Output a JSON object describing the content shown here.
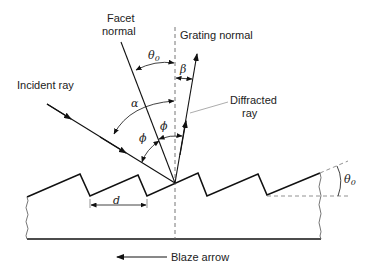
{
  "figure": {
    "labels": {
      "facet_normal_line1": "Facet",
      "facet_normal_line2": "normal",
      "grating_normal": "Grating normal",
      "incident_ray": "Incident ray",
      "diffracted_ray_line1": "Diffracted",
      "diffracted_ray_line2": "ray",
      "blaze_arrow": "Blaze arrow",
      "groove_spacing": "d"
    },
    "angles": {
      "theta0_symbol": "θ",
      "theta0_subscript": "0",
      "alpha": "α",
      "beta": "β",
      "phi": "ϕ"
    },
    "colors": {
      "line": "#111111",
      "dashed": "#555555",
      "leader": "#888888",
      "background": "#ffffff"
    }
  }
}
